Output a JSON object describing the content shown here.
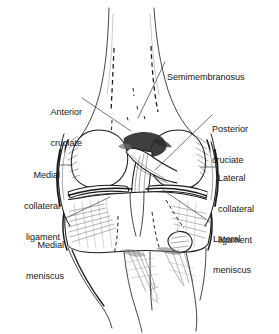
{
  "figure": {
    "background_color": "#ffffff",
    "ink_color": "#1b1b1b",
    "signature": "artist-signature"
  },
  "labels": {
    "semimembranosus": {
      "text": "Semimembranosus",
      "lines": [
        "Semimembranosus"
      ]
    },
    "anterior_cruciate": {
      "text": "Anterior cruciate",
      "line1": "Anterior",
      "line2": "cruciate"
    },
    "posterior_cruciate": {
      "text": "Posterior cruciate",
      "line1": "Posterior",
      "line2": "cruciate"
    },
    "medial_collateral_ligament": {
      "text": "Medial collateral ligament",
      "line1": "Medial",
      "line2": "collateral",
      "line3": "ligament"
    },
    "lateral_collateral_ligament": {
      "text": "Lateral collateral ligament",
      "line1": "Lateral",
      "line2": "collateral",
      "line3": "ligament"
    },
    "medial_meniscus": {
      "text": "Medial meniscus",
      "line1": "Medial",
      "line2": "meniscus"
    },
    "lateral_meniscus": {
      "text": "Lateral meniscus",
      "line1": "Lateral",
      "line2": "meniscus"
    }
  }
}
